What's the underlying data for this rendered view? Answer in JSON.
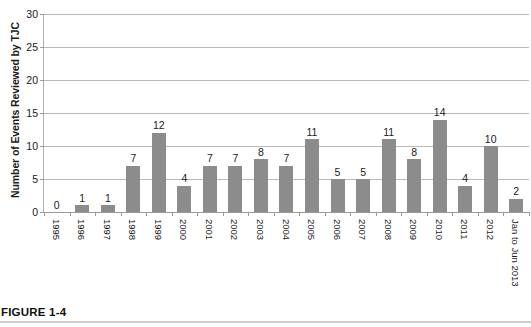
{
  "figure": {
    "caption_label": "FIGURE 1-4"
  },
  "chart_data": {
    "type": "bar",
    "title": "",
    "subtitle": "",
    "xlabel": "",
    "ylabel": "Number of Events Reviewed by TJC",
    "ylim": [
      0,
      30
    ],
    "yticks": [
      0,
      5,
      10,
      15,
      20,
      25,
      30
    ],
    "ytick_labels": [
      "0",
      "5",
      "10",
      "15",
      "20",
      "25",
      "30"
    ],
    "grid": true,
    "legend": false,
    "bar_color": "#8c8c8c",
    "gridline_color": "#b9b9b9",
    "axis_color": "#9a9a9a",
    "categories": [
      "1995",
      "1996",
      "1997",
      "1998",
      "1999",
      "2000",
      "2001",
      "2002",
      "2003",
      "2004",
      "2005",
      "2006",
      "2007",
      "2008",
      "2009",
      "2010",
      "2011",
      "2012",
      "Jan to Jun 2013"
    ],
    "values": [
      0,
      1,
      1,
      7,
      12,
      4,
      7,
      7,
      8,
      7,
      11,
      5,
      5,
      11,
      8,
      14,
      4,
      10,
      2
    ],
    "data_labels": [
      "0",
      "1",
      "1",
      "7",
      "12",
      "4",
      "7",
      "7",
      "8",
      "7",
      "11",
      "5",
      "5",
      "11",
      "8",
      "14",
      "4",
      "10",
      "2"
    ]
  }
}
